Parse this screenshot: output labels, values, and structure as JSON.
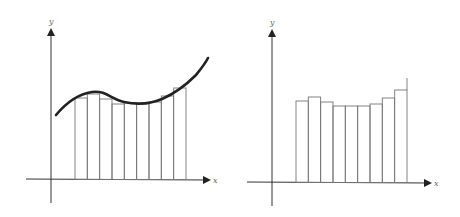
{
  "left_panel": {
    "x_label": "x",
    "y_label": "y",
    "description": "Curve with inscribed rectangles (Riemann sum approximation)"
  },
  "right_panel": {
    "x_label": "x",
    "y_label": "y",
    "description": "Rectangles only (Riemann sum approximation without curve)"
  },
  "diagram": {
    "rect_count": 9,
    "left_rect_tops": [
      98,
      94,
      99,
      104,
      103,
      104,
      102,
      96,
      88
    ],
    "right_rect_tops": [
      101,
      97,
      102,
      106,
      106,
      106,
      104,
      98,
      90
    ]
  }
}
